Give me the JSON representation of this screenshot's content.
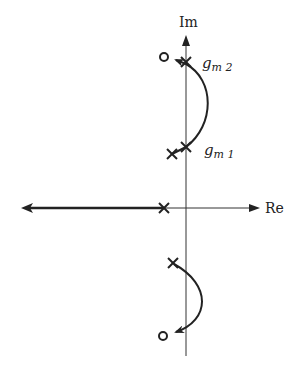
{
  "diagram": {
    "type": "root-locus",
    "axes": {
      "imag_label": "Im",
      "real_label": "Re"
    },
    "labels": {
      "gm2": {
        "base": "g",
        "sub": "m 2"
      },
      "gm1": {
        "base": "g",
        "sub": "m 1"
      }
    },
    "poles": [
      {
        "name": "gm2-pole",
        "x": 186,
        "y": 62
      },
      {
        "name": "gm1-pole",
        "x": 186,
        "y": 147
      },
      {
        "name": "upper-left-pole",
        "x": 172,
        "y": 154
      },
      {
        "name": "real-axis-pole",
        "x": 164,
        "y": 208
      },
      {
        "name": "lower-pole",
        "x": 173,
        "y": 263
      }
    ],
    "zeros": [
      {
        "name": "upper-zero",
        "x": 164,
        "y": 57
      },
      {
        "name": "lower-zero",
        "x": 163,
        "y": 336
      }
    ],
    "colors": {
      "stroke": "#222222",
      "background": "#ffffff"
    }
  }
}
